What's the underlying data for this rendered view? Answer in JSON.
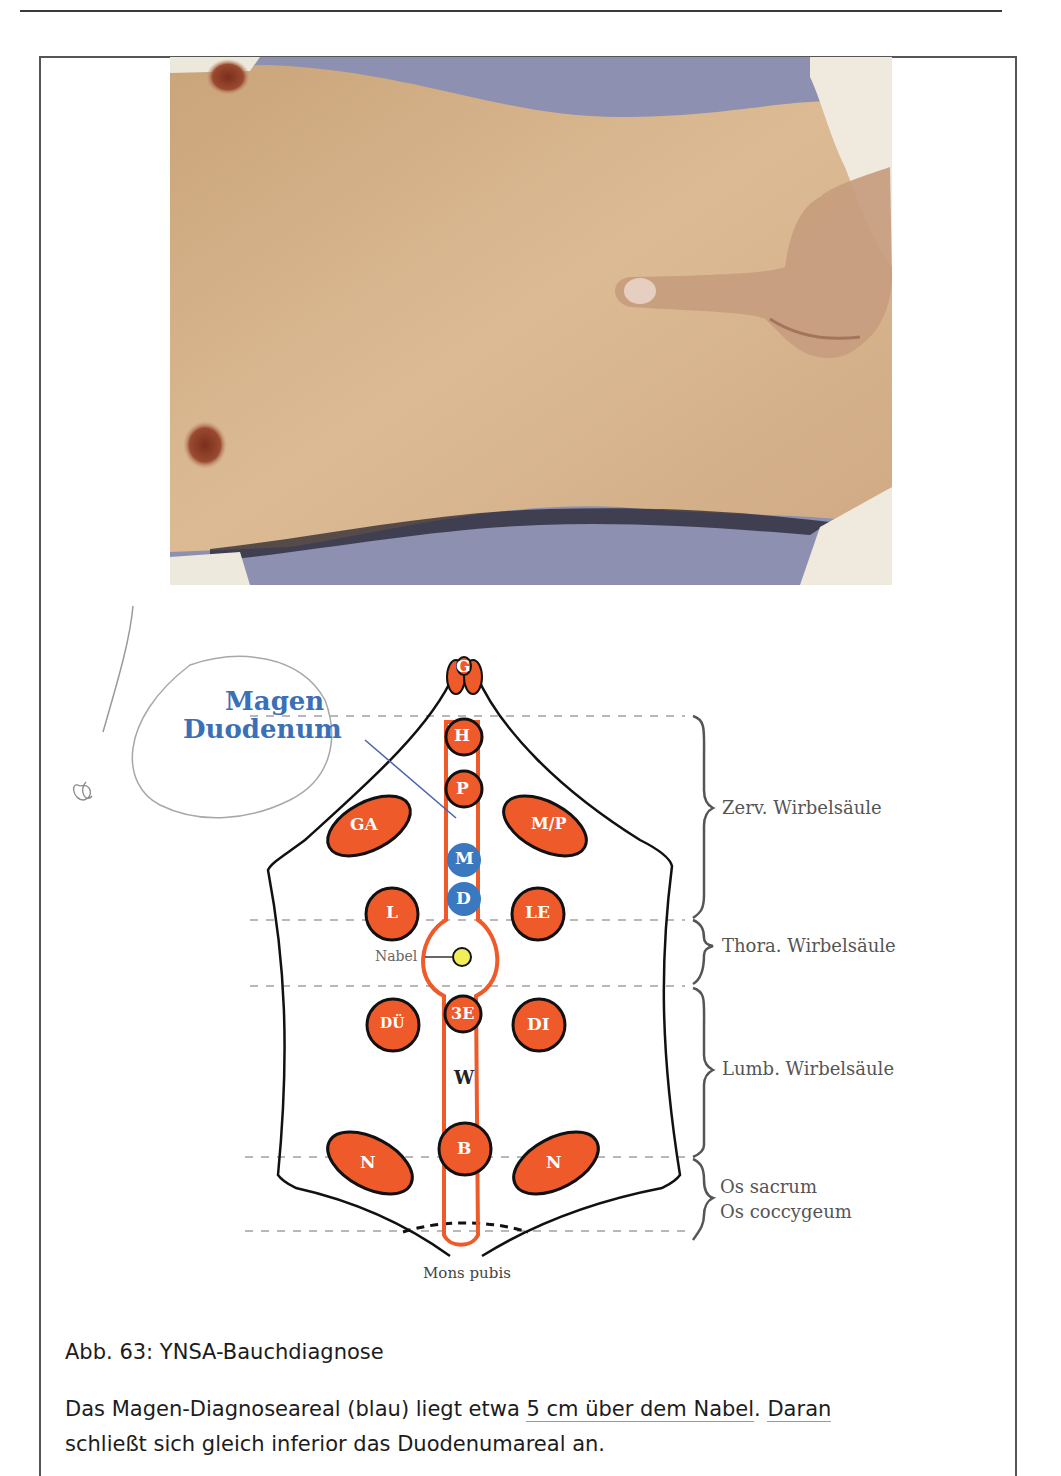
{
  "page": {
    "figure": {
      "photo": {
        "description": "Abdomen of a patient lying supine with examiner's finger pressing above the navel",
        "colors": {
          "skin": "#d7b38a",
          "background_sheet": "#8b8fb0",
          "towel": "#ece8dc"
        }
      },
      "diagram": {
        "annotation_title_line1": "Magen",
        "annotation_title_line2": "Duodenum",
        "points": [
          {
            "label": "G",
            "color": "orange"
          },
          {
            "label": "H",
            "color": "orange"
          },
          {
            "label": "P",
            "color": "orange"
          },
          {
            "label": "GA",
            "color": "orange"
          },
          {
            "label": "M/P",
            "color": "orange"
          },
          {
            "label": "M",
            "color": "blue"
          },
          {
            "label": "D",
            "color": "blue"
          },
          {
            "label": "L",
            "color": "orange"
          },
          {
            "label": "LE",
            "color": "orange"
          },
          {
            "label": "3E",
            "color": "orange"
          },
          {
            "label": "DÜ",
            "color": "orange"
          },
          {
            "label": "DI",
            "color": "orange"
          },
          {
            "label": "W",
            "color": "none"
          },
          {
            "label": "B",
            "color": "orange"
          },
          {
            "label": "N",
            "color": "orange"
          },
          {
            "label": "N",
            "color": "orange"
          }
        ],
        "navel_label": "Nabel",
        "bottom_label": "Mons pubis",
        "spine_regions": [
          "Zerv. Wirbelsäule",
          "Thora. Wirbelsäule",
          "Lumb. Wirbelsäule",
          "Os sacrum",
          "Os coccygeum"
        ],
        "colors": {
          "orange": "#ee5a2a",
          "blue": "#3a78c0",
          "navel_yellow": "#f2ee5a",
          "annotation_blue": "#3b6fb6",
          "label_gray": "#555555"
        }
      }
    },
    "caption": "Abb. 63:  YNSA-Bauchdiagnose",
    "body": {
      "line1_a": "Das Magen-Diagnoseareal (blau) liegt etwa ",
      "line1_u1": "5 cm über dem Nabel",
      "line1_b": ". ",
      "line1_u2": "Daran",
      "line2": "schließt sich gleich inferior das Duodenumareal an."
    }
  }
}
